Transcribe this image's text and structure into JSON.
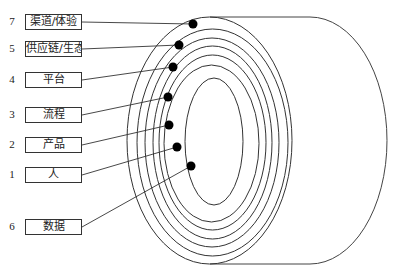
{
  "diagram": {
    "type": "concentric-cylinder-layers",
    "layers": [
      {
        "number": "7",
        "label": "渠道/体验",
        "box_top": 14,
        "dot": [
          193,
          24
        ]
      },
      {
        "number": "5",
        "label": "供应链/生态",
        "box_top": 41,
        "dot": [
          179,
          45
        ]
      },
      {
        "number": "4",
        "label": "平台",
        "box_top": 72,
        "dot": [
          173,
          67
        ]
      },
      {
        "number": "3",
        "label": "流程",
        "box_top": 107,
        "dot": [
          168,
          97
        ]
      },
      {
        "number": "2",
        "label": "产品",
        "box_top": 137,
        "dot": [
          169,
          125
        ]
      },
      {
        "number": "1",
        "label": "人",
        "box_top": 167,
        "dot": [
          177,
          147
        ]
      },
      {
        "number": "6",
        "label": "数据",
        "box_top": 219,
        "dot": [
          191,
          166
        ]
      }
    ],
    "colors": {
      "stroke": "#333333",
      "dot": "#000000",
      "background": "#ffffff"
    }
  }
}
